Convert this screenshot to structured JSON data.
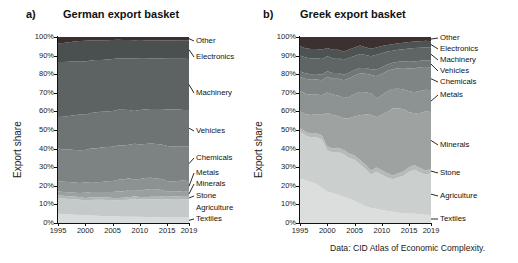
{
  "figure": {
    "caption": "Data: CID Atlas of Economic Complexity.",
    "ylabel": "Export share"
  },
  "panels": [
    {
      "letter": "a)",
      "title": "German export basket",
      "ylabel": "Export share",
      "annotations": [
        "Other",
        "Electronics",
        "Machinery",
        "Vehicles",
        "Chemicals",
        "Metals",
        "Minerals",
        "Stone",
        "Agriculture",
        "Textiles"
      ]
    },
    {
      "letter": "b)",
      "title": "Greek export basket",
      "ylabel": "Export share",
      "annotations": [
        "Other",
        "Electronics",
        "Machinery",
        "Vehicles",
        "Chemicals",
        "Metals",
        "Minerals",
        "Stone",
        "Agriculture",
        "Textiles"
      ]
    }
  ],
  "chart_data": [
    {
      "type": "area",
      "title": "German export basket",
      "subtitle": "a)",
      "xlabel": "",
      "ylabel": "Export share",
      "xlim": [
        1995,
        2019
      ],
      "ylim": [
        0,
        100
      ],
      "xticks": [
        1995,
        2000,
        2005,
        2010,
        2015,
        2019
      ],
      "yticks": [
        "0%",
        "10%",
        "20%",
        "30%",
        "40%",
        "50%",
        "60%",
        "70%",
        "80%",
        "90%",
        "100%"
      ],
      "grid": false,
      "legend_position": "right-annotations",
      "stacked": true,
      "x": [
        1995,
        1996,
        1997,
        1998,
        1999,
        2000,
        2001,
        2002,
        2003,
        2004,
        2005,
        2006,
        2007,
        2008,
        2009,
        2010,
        2011,
        2012,
        2013,
        2014,
        2015,
        2016,
        2017,
        2018,
        2019
      ],
      "series": [
        {
          "name": "Textiles",
          "color": "#d9dcdc",
          "values": [
            5.0,
            4.8,
            4.6,
            4.5,
            4.3,
            4.1,
            4.0,
            3.9,
            3.8,
            3.7,
            3.6,
            3.5,
            3.4,
            3.3,
            3.4,
            3.3,
            3.2,
            3.2,
            3.1,
            3.1,
            3.0,
            3.0,
            3.0,
            2.9,
            2.9
          ]
        },
        {
          "name": "Agriculture",
          "color": "#c4c9c9",
          "values": [
            8.5,
            8.4,
            8.3,
            8.3,
            8.2,
            8.1,
            8.4,
            8.6,
            8.7,
            8.7,
            8.6,
            8.7,
            8.9,
            9.2,
            9.6,
            9.4,
            9.4,
            9.6,
            9.7,
            9.8,
            9.8,
            9.9,
            9.9,
            9.9,
            9.9
          ]
        },
        {
          "name": "Stone",
          "color": "#b0b5b5",
          "values": [
            1.4,
            1.4,
            1.4,
            1.4,
            1.3,
            1.3,
            1.3,
            1.3,
            1.3,
            1.3,
            1.3,
            1.3,
            1.3,
            1.3,
            1.4,
            1.3,
            1.3,
            1.3,
            1.3,
            1.3,
            1.3,
            1.3,
            1.3,
            1.3,
            1.3
          ]
        },
        {
          "name": "Minerals",
          "color": "#9aa0a0",
          "values": [
            2.1,
            2.1,
            2.2,
            2.1,
            2.3,
            2.7,
            2.9,
            2.8,
            2.8,
            2.9,
            3.2,
            3.5,
            3.4,
            3.9,
            3.3,
            3.6,
            4.0,
            4.2,
            4.0,
            3.6,
            2.9,
            2.6,
            2.8,
            3.1,
            3.0
          ]
        },
        {
          "name": "Metals",
          "color": "#8c9292",
          "values": [
            5.6,
            5.5,
            5.6,
            5.5,
            5.4,
            5.6,
            5.5,
            5.3,
            5.4,
            5.8,
            5.9,
            6.3,
            6.4,
            6.3,
            5.6,
            6.0,
            6.3,
            6.0,
            5.8,
            5.8,
            5.6,
            5.4,
            5.6,
            5.6,
            5.4
          ]
        },
        {
          "name": "Chemicals",
          "color": "#7d8383",
          "values": [
            17.4,
            17.3,
            17.4,
            17.5,
            17.6,
            17.4,
            18.0,
            18.3,
            18.6,
            18.5,
            18.4,
            18.3,
            18.3,
            18.1,
            19.3,
            18.6,
            18.3,
            18.4,
            18.6,
            18.6,
            18.8,
            18.9,
            18.7,
            18.5,
            18.8
          ]
        },
        {
          "name": "Vehicles",
          "color": "#6e7474",
          "values": [
            17.0,
            17.6,
            18.0,
            18.6,
            19.2,
            19.0,
            19.0,
            19.4,
            19.2,
            19.0,
            19.2,
            19.3,
            19.2,
            18.6,
            17.6,
            18.5,
            18.5,
            18.6,
            18.8,
            19.1,
            19.6,
            19.9,
            19.7,
            19.5,
            19.4
          ]
        },
        {
          "name": "Machinery",
          "color": "#5d6363",
          "values": [
            29.5,
            29.4,
            29.2,
            29.0,
            28.6,
            28.6,
            28.2,
            28.1,
            27.9,
            28.0,
            28.0,
            27.6,
            27.6,
            27.8,
            28.2,
            27.6,
            27.3,
            27.1,
            27.2,
            27.1,
            27.3,
            27.3,
            27.3,
            27.5,
            27.5
          ]
        },
        {
          "name": "Electronics",
          "color": "#4a5050",
          "values": [
            10.2,
            10.3,
            10.5,
            10.7,
            11.0,
            11.2,
            10.8,
            10.5,
            10.5,
            10.4,
            10.2,
            10.0,
            9.9,
            9.9,
            9.9,
            10.1,
            9.9,
            9.8,
            9.7,
            9.7,
            9.8,
            9.8,
            9.9,
            9.9,
            10.0
          ]
        },
        {
          "name": "Other",
          "color": "#3a2e2e",
          "values": [
            3.3,
            3.2,
            2.8,
            2.4,
            2.1,
            2.0,
            1.9,
            1.8,
            1.8,
            1.7,
            1.6,
            1.5,
            1.6,
            1.6,
            1.7,
            1.6,
            1.8,
            1.8,
            1.8,
            1.9,
            1.9,
            1.9,
            1.8,
            1.8,
            1.8
          ]
        }
      ]
    },
    {
      "type": "area",
      "title": "Greek export basket",
      "subtitle": "b)",
      "xlabel": "",
      "ylabel": "Export share",
      "xlim": [
        1995,
        2019
      ],
      "ylim": [
        0,
        100
      ],
      "xticks": [
        1995,
        2000,
        2005,
        2010,
        2015,
        2019
      ],
      "yticks": [
        "0%",
        "10%",
        "20%",
        "30%",
        "40%",
        "50%",
        "60%",
        "70%",
        "80%",
        "90%",
        "100%"
      ],
      "grid": false,
      "legend_position": "right-annotations",
      "stacked": true,
      "x": [
        1995,
        1996,
        1997,
        1998,
        1999,
        2000,
        2001,
        2002,
        2003,
        2004,
        2005,
        2006,
        2007,
        2008,
        2009,
        2010,
        2011,
        2012,
        2013,
        2014,
        2015,
        2016,
        2017,
        2018,
        2019
      ],
      "series": [
        {
          "name": "Textiles",
          "color": "#dbdedd",
          "values": [
            24.0,
            23.0,
            22.0,
            21.0,
            19.0,
            17.0,
            16.0,
            15.0,
            14.0,
            13.0,
            12.0,
            10.5,
            9.0,
            8.0,
            7.5,
            7.0,
            6.5,
            6.0,
            5.5,
            5.2,
            5.0,
            4.8,
            4.6,
            4.4,
            4.2
          ]
        },
        {
          "name": "Agriculture",
          "color": "#cbcfce",
          "values": [
            25.0,
            24.0,
            24.0,
            25.0,
            26.0,
            22.0,
            22.0,
            23.0,
            23.0,
            22.0,
            22.0,
            21.0,
            20.0,
            18.0,
            20.0,
            19.0,
            18.0,
            17.5,
            19.0,
            20.0,
            22.0,
            23.0,
            22.0,
            21.0,
            22.0
          ]
        },
        {
          "name": "Stone",
          "color": "#b6bab9",
          "values": [
            2.0,
            2.0,
            2.0,
            2.1,
            2.2,
            2.1,
            2.1,
            2.2,
            2.2,
            2.3,
            2.3,
            2.4,
            2.3,
            2.2,
            2.4,
            2.3,
            2.2,
            2.1,
            2.2,
            2.3,
            2.4,
            2.4,
            2.4,
            2.3,
            2.3
          ]
        },
        {
          "name": "Minerals",
          "color": "#9ea3a2",
          "values": [
            9.0,
            9.5,
            10.0,
            10.5,
            11.0,
            18.0,
            18.0,
            17.0,
            17.0,
            19.0,
            21.0,
            24.0,
            27.0,
            30.0,
            27.0,
            30.0,
            33.0,
            36.0,
            35.0,
            33.0,
            29.0,
            27.0,
            29.0,
            31.0,
            30.0
          ]
        },
        {
          "name": "Metals",
          "color": "#8d9292",
          "values": [
            11.0,
            11.0,
            11.0,
            10.5,
            10.5,
            11.0,
            11.0,
            11.0,
            11.0,
            11.5,
            12.0,
            12.5,
            12.0,
            11.5,
            10.0,
            10.5,
            11.0,
            10.5,
            10.5,
            10.5,
            11.0,
            11.0,
            11.5,
            11.5,
            11.5
          ]
        },
        {
          "name": "Chemicals",
          "color": "#7f8484",
          "values": [
            7.5,
            8.0,
            8.0,
            8.0,
            8.0,
            8.5,
            8.5,
            9.0,
            9.5,
            10.0,
            10.0,
            10.0,
            10.0,
            10.0,
            12.0,
            11.5,
            11.0,
            10.5,
            11.0,
            11.5,
            12.0,
            12.5,
            12.5,
            12.0,
            12.0
          ]
        },
        {
          "name": "Vehicles",
          "color": "#707575",
          "values": [
            3.0,
            3.0,
            3.0,
            3.0,
            3.0,
            3.0,
            3.0,
            3.0,
            3.0,
            3.0,
            3.0,
            3.0,
            3.0,
            3.0,
            3.5,
            3.5,
            3.5,
            3.5,
            3.5,
            3.5,
            3.5,
            3.5,
            3.5,
            3.5,
            3.5
          ]
        },
        {
          "name": "Machinery",
          "color": "#5f6464",
          "values": [
            8.5,
            8.5,
            8.5,
            8.5,
            8.5,
            8.0,
            8.0,
            8.0,
            8.0,
            8.0,
            7.5,
            7.5,
            7.0,
            7.0,
            8.0,
            7.5,
            7.0,
            6.5,
            6.5,
            6.5,
            7.0,
            7.0,
            6.8,
            6.8,
            6.8
          ]
        },
        {
          "name": "Electronics",
          "color": "#4d5252",
          "values": [
            5.0,
            5.0,
            5.0,
            5.0,
            5.0,
            4.5,
            4.5,
            4.5,
            4.5,
            4.5,
            4.5,
            4.5,
            4.2,
            4.0,
            4.0,
            3.8,
            3.5,
            3.5,
            3.5,
            3.5,
            3.5,
            3.5,
            3.5,
            3.5,
            3.5
          ]
        },
        {
          "name": "Other",
          "color": "#3c3030",
          "values": [
            5.0,
            6.0,
            6.5,
            6.4,
            6.8,
            5.9,
            6.9,
            6.8,
            7.8,
            6.7,
            5.7,
            4.6,
            5.5,
            6.3,
            5.6,
            4.9,
            4.3,
            3.9,
            3.3,
            3.0,
            2.6,
            2.3,
            2.2,
            2.0,
            2.2
          ]
        }
      ]
    }
  ]
}
